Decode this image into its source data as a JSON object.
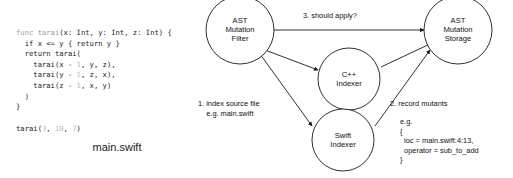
{
  "code_panel": {
    "file_label": "main.swift",
    "code_lines": [
      [
        {
          "t": "func ",
          "c": "kw"
        },
        {
          "t": "tarai",
          "c": "kw"
        },
        {
          "t": "(x: Int, y: Int, z: Int) {",
          "c": ""
        }
      ],
      [
        {
          "t": "  if x <= y { return y }",
          "c": ""
        }
      ],
      [
        {
          "t": "  return tarai(",
          "c": ""
        }
      ],
      [
        {
          "t": "    tarai(x - ",
          "c": ""
        },
        {
          "t": "1",
          "c": "num"
        },
        {
          "t": ", y, z),",
          "c": ""
        }
      ],
      [
        {
          "t": "    tarai(y - ",
          "c": ""
        },
        {
          "t": "1",
          "c": "num"
        },
        {
          "t": ", z, x),",
          "c": ""
        }
      ],
      [
        {
          "t": "    tarai(z - ",
          "c": ""
        },
        {
          "t": "1",
          "c": "num"
        },
        {
          "t": ", x, y)",
          "c": ""
        }
      ],
      [
        {
          "t": "  )",
          "c": ""
        }
      ],
      [
        {
          "t": "}",
          "c": ""
        }
      ]
    ],
    "call_line": [
      {
        "t": "tarai(",
        "c": ""
      },
      {
        "t": "3",
        "c": "num"
      },
      {
        "t": ", ",
        "c": ""
      },
      {
        "t": "10",
        "c": "num"
      },
      {
        "t": ", ",
        "c": ""
      },
      {
        "t": "7",
        "c": "num"
      },
      {
        "t": ")",
        "c": ""
      }
    ]
  },
  "diagram": {
    "nodes": {
      "ast_mutation_filter": {
        "line1": "AST",
        "line2": "Mutation",
        "line3": "Filter"
      },
      "cpp_indexer": {
        "line1": "C++",
        "line2": "Indexer",
        "line3": ""
      },
      "swift_indexer": {
        "line1": "Swift",
        "line2": "Indexer",
        "line3": ""
      },
      "ast_mutation_storage": {
        "line1": "AST",
        "line2": "Mutation",
        "line3": "Storage"
      }
    },
    "annotations": {
      "should_apply": "3. should apply?",
      "index_source": "1. index source file\n    e.g. main.swift",
      "record_mutants_title": "2. record mutants",
      "record_mutants_body": "e.g.\n{\n  loc = main.swift:4:13,\n  operator = sub_to_add\n}"
    }
  },
  "colors": {
    "stroke": "#1a1a1a",
    "text": "#111111",
    "code_text": "#222222",
    "code_keyword": "#9a9a9a",
    "code_number": "#b9b9b9",
    "background": "#ffffff"
  }
}
